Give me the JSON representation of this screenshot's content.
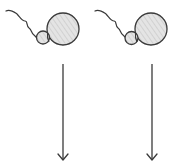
{
  "diagram": {
    "colors": {
      "stroke": "#3a3a3a",
      "fill": "#e2e2e2",
      "hatch": "#bdbdbd",
      "background": "#ffffff"
    },
    "figures": [
      {
        "id": "left",
        "icon": "sperm-cell-icon",
        "arrow": "arrow-down-icon"
      },
      {
        "id": "right",
        "icon": "sperm-cell-icon",
        "arrow": "arrow-down-icon"
      }
    ]
  }
}
